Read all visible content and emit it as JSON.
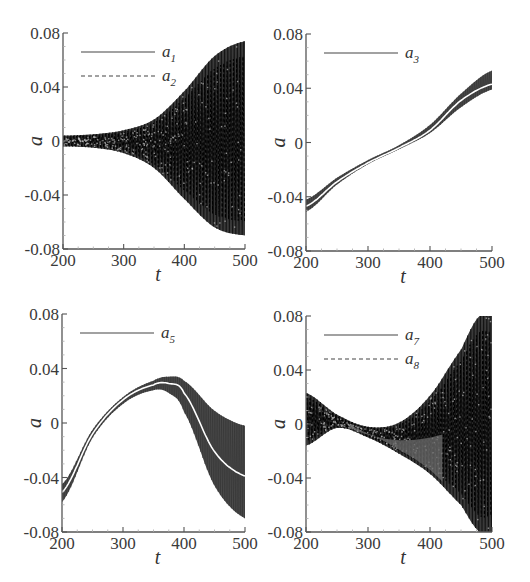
{
  "figure": {
    "band_color": "#1a1a1a",
    "band_color_gray": "#4a4a4a",
    "centerline_color": "#ffffff",
    "axis_color": "#555555"
  },
  "chart_data": [
    {
      "id": "panel-a1-a2",
      "type": "line",
      "title": "",
      "xlabel": "t",
      "ylabel": "a",
      "xlim": [
        200,
        500
      ],
      "ylim": [
        -0.08,
        0.08
      ],
      "xticks": [
        "200",
        "300",
        "400",
        "500"
      ],
      "yticks": [
        "-0.08",
        "-0.04",
        "0",
        "0.04",
        "0.08"
      ],
      "grid": false,
      "legend_position": "upper-left",
      "legend": [
        {
          "label": "a",
          "sub": "1",
          "style": "solid"
        },
        {
          "label": "a",
          "sub": "2",
          "style": "dashed"
        }
      ],
      "box": {
        "x0": 63,
        "y0": 33,
        "x1": 245,
        "y1": 249
      },
      "x": [
        200,
        250,
        300,
        350,
        400,
        450,
        500
      ],
      "series": [
        {
          "name": "a1/a2 envelope upper",
          "values": [
            0.004,
            0.005,
            0.008,
            0.016,
            0.037,
            0.063,
            0.074
          ]
        },
        {
          "name": "a1/a2 envelope lower",
          "values": [
            -0.004,
            -0.005,
            -0.009,
            -0.02,
            -0.043,
            -0.064,
            -0.07
          ]
        },
        {
          "name": "a1/a2 mean",
          "values": [
            0,
            0,
            0,
            0,
            0,
            0,
            0
          ]
        }
      ],
      "centerline": false,
      "band_style": "dark-oscillation"
    },
    {
      "id": "panel-a3",
      "type": "line",
      "title": "",
      "xlabel": "t",
      "ylabel": "a",
      "xlim": [
        200,
        500
      ],
      "ylim": [
        -0.08,
        0.08
      ],
      "xticks": [
        "200",
        "300",
        "400",
        "500"
      ],
      "yticks": [
        "-0.08",
        "-0.04",
        "0",
        "0.04",
        "0.08"
      ],
      "grid": false,
      "legend_position": "upper-left",
      "legend": [
        {
          "label": "a",
          "sub": "3",
          "style": "solid"
        }
      ],
      "box": {
        "x0": 306,
        "y0": 34,
        "x1": 492,
        "y1": 251
      },
      "x": [
        200,
        250,
        300,
        350,
        400,
        450,
        500
      ],
      "series": [
        {
          "name": "a3 envelope upper",
          "values": [
            -0.042,
            -0.026,
            -0.013,
            -0.002,
            0.013,
            0.036,
            0.053
          ]
        },
        {
          "name": "a3 envelope lower",
          "values": [
            -0.051,
            -0.031,
            -0.016,
            -0.005,
            0.007,
            0.026,
            0.039
          ]
        },
        {
          "name": "a3 mean",
          "values": [
            -0.047,
            -0.029,
            -0.015,
            -0.004,
            0.009,
            0.031,
            0.043
          ]
        }
      ],
      "centerline": true,
      "band_style": "gray"
    },
    {
      "id": "panel-a5",
      "type": "line",
      "title": "",
      "xlabel": "t",
      "ylabel": "a",
      "xlim": [
        200,
        500
      ],
      "ylim": [
        -0.08,
        0.08
      ],
      "xticks": [
        "200",
        "300",
        "400",
        "500"
      ],
      "yticks": [
        "-0.08",
        "-0.04",
        "0",
        "0.04",
        "0.08"
      ],
      "grid": false,
      "legend_position": "upper-left",
      "legend": [
        {
          "label": "a",
          "sub": "5",
          "style": "solid"
        }
      ],
      "box": {
        "x0": 62,
        "y0": 314,
        "x1": 245,
        "y1": 532
      },
      "x": [
        200,
        250,
        300,
        350,
        375,
        400,
        450,
        500
      ],
      "series": [
        {
          "name": "a5 envelope upper",
          "values": [
            -0.045,
            -0.005,
            0.019,
            0.031,
            0.034,
            0.031,
            0.009,
            -0.002
          ]
        },
        {
          "name": "a5 envelope lower",
          "values": [
            -0.058,
            -0.011,
            0.014,
            0.024,
            0.022,
            0.008,
            -0.046,
            -0.07
          ]
        },
        {
          "name": "a5 mean",
          "values": [
            -0.051,
            -0.008,
            0.017,
            0.028,
            0.029,
            0.022,
            -0.021,
            -0.039
          ]
        }
      ],
      "centerline": true,
      "band_style": "gray"
    },
    {
      "id": "panel-a7-a8",
      "type": "line",
      "title": "",
      "xlabel": "t",
      "ylabel": "a",
      "xlim": [
        200,
        500
      ],
      "ylim": [
        -0.08,
        0.08
      ],
      "xticks": [
        "200",
        "300",
        "400",
        "500"
      ],
      "yticks": [
        "-0.08",
        "-0.04",
        "0",
        "0.04",
        "0.08"
      ],
      "grid": false,
      "legend_position": "upper-left",
      "legend": [
        {
          "label": "a",
          "sub": "7",
          "style": "solid"
        },
        {
          "label": "a",
          "sub": "8",
          "style": "dashed"
        }
      ],
      "box": {
        "x0": 306,
        "y0": 316,
        "x1": 492,
        "y1": 532
      },
      "x": [
        200,
        250,
        300,
        350,
        400,
        450,
        480,
        500
      ],
      "series": [
        {
          "name": "a7/a8 envelope upper",
          "values": [
            0.023,
            0.007,
            -0.002,
            0.001,
            0.021,
            0.055,
            0.08,
            0.08
          ]
        },
        {
          "name": "a7/a8 envelope lower",
          "values": [
            -0.016,
            -0.003,
            -0.01,
            -0.022,
            -0.037,
            -0.06,
            -0.08,
            -0.08
          ]
        },
        {
          "name": "a7/a8 mean",
          "values": [
            0.003,
            0.002,
            -0.006,
            -0.01,
            -0.008,
            -0.002,
            0,
            0
          ]
        }
      ],
      "centerline": false,
      "band_style": "dark-oscillation"
    }
  ]
}
